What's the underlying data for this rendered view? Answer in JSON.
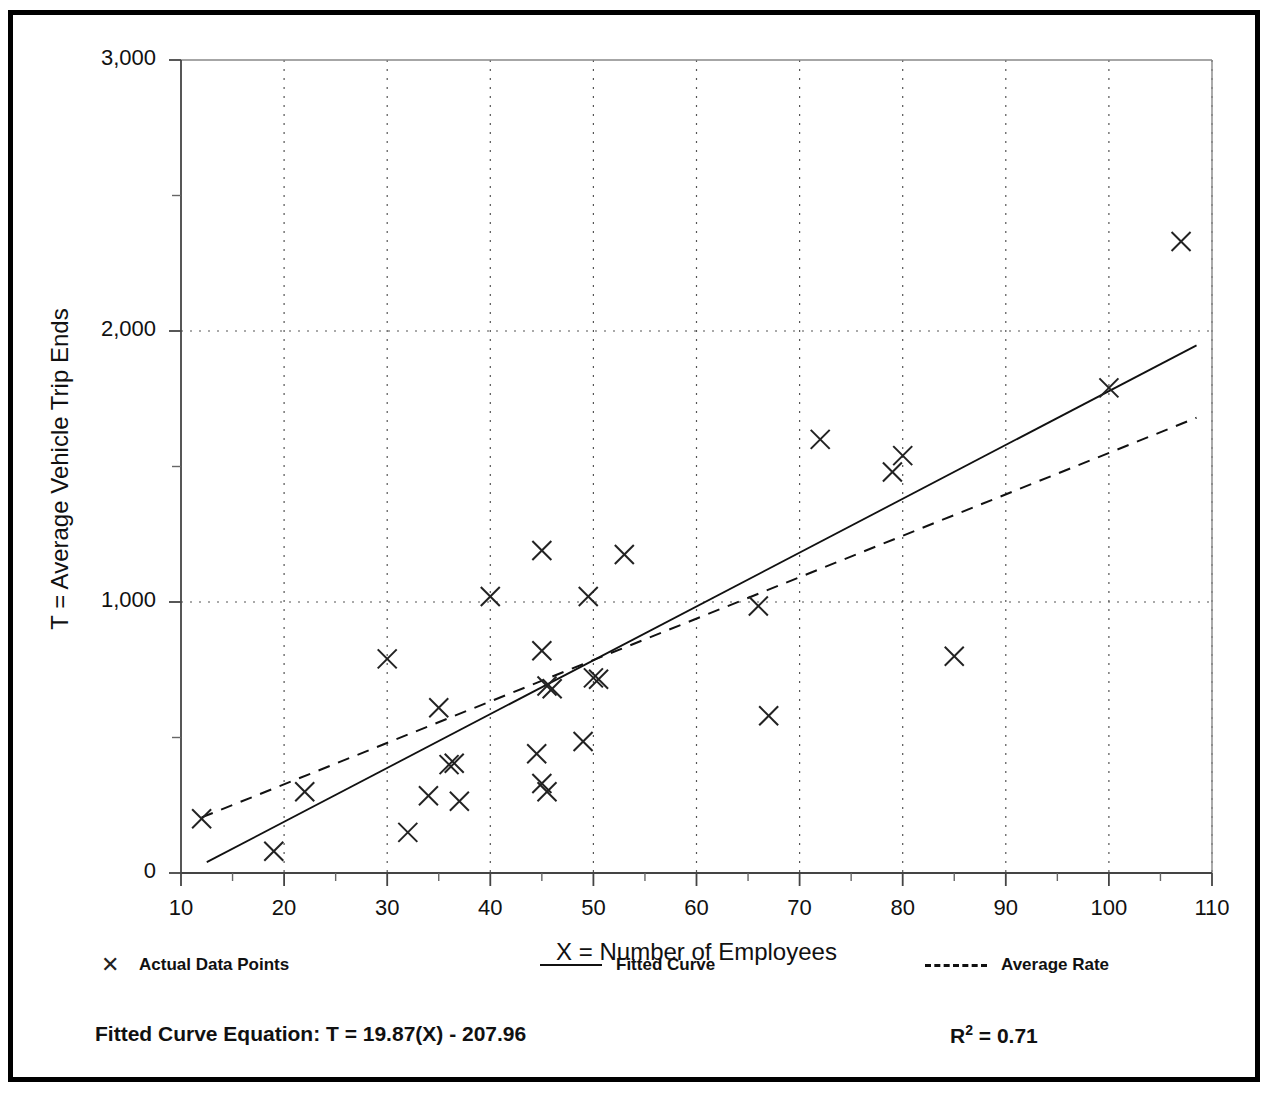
{
  "chart_data": {
    "type": "scatter",
    "title": "",
    "xlabel": "X = Number of Employees",
    "ylabel": "T = Average Vehicle Trip Ends",
    "xlim": [
      10,
      110
    ],
    "ylim": [
      0,
      3000
    ],
    "xticks": [
      10,
      20,
      30,
      40,
      50,
      60,
      70,
      80,
      90,
      100,
      110
    ],
    "xtick_labels": [
      "10",
      "20",
      "30",
      "40",
      "50",
      "60",
      "70",
      "80",
      "90",
      "100",
      "110"
    ],
    "yticks": [
      0,
      1000,
      2000,
      3000
    ],
    "ytick_labels": [
      "0",
      "1,000",
      "2,000",
      "3,000"
    ],
    "y_minor_ticks": [
      500,
      1500,
      2500
    ],
    "grid": "dotted-both-axes",
    "legend_position": "below-axes",
    "series": [
      {
        "name": "Actual Data Points",
        "type": "scatter",
        "marker": "x",
        "points": [
          [
            12,
            200
          ],
          [
            19,
            80
          ],
          [
            22,
            300
          ],
          [
            30,
            790
          ],
          [
            32,
            150
          ],
          [
            34,
            285
          ],
          [
            35,
            610
          ],
          [
            36,
            400
          ],
          [
            36.5,
            405
          ],
          [
            37,
            265
          ],
          [
            40,
            1020
          ],
          [
            44.5,
            440
          ],
          [
            45,
            1190
          ],
          [
            45,
            820
          ],
          [
            45,
            330
          ],
          [
            45.5,
            300
          ],
          [
            45.5,
            690
          ],
          [
            46,
            680
          ],
          [
            49,
            485
          ],
          [
            49.5,
            1020
          ],
          [
            50,
            720
          ],
          [
            50.5,
            715
          ],
          [
            53,
            1175
          ],
          [
            66,
            985
          ],
          [
            67,
            580
          ],
          [
            72,
            1600
          ],
          [
            79,
            1480
          ],
          [
            80,
            1540
          ],
          [
            85,
            800
          ],
          [
            100,
            1790
          ],
          [
            107,
            2330
          ]
        ]
      },
      {
        "name": "Fitted Curve",
        "type": "line",
        "style": "solid",
        "equation": "T = 19.87(X) - 207.96",
        "slope": 19.87,
        "intercept": -207.96,
        "endpoints": [
          [
            12.5,
            40
          ],
          [
            108.5,
            1947
          ]
        ]
      },
      {
        "name": "Average Rate",
        "type": "line",
        "style": "dashed",
        "endpoints": [
          [
            12,
            205
          ],
          [
            108.5,
            1680
          ]
        ]
      }
    ],
    "annotations": {
      "fitted_curve_equation_label": "Fitted Curve Equation:  T = 19.87(X) - 207.96",
      "r_squared_label": "R",
      "r_squared_sup": "2",
      "r_squared_value": " = 0.71"
    },
    "legend_entries": [
      {
        "label": "Actual Data Points",
        "marker": "x-marker"
      },
      {
        "label": "Fitted Curve",
        "marker": "solid-line"
      },
      {
        "label": "Average Rate",
        "marker": "dashed-line"
      }
    ]
  }
}
